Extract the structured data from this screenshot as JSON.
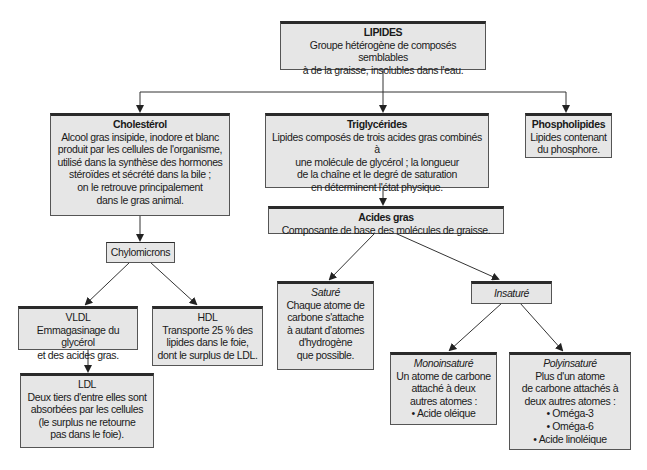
{
  "diagram": {
    "root": {
      "title": "LIPIDES",
      "desc": "Groupe hétérogène de composés semblables\nà de la graisse, insolubles dans l'eau."
    },
    "cholesterol": {
      "title": "Cholestérol",
      "desc": "Alcool gras insipide, inodore et blanc\nproduit par les cellules de l'organisme,\nutilisé dans la synthèse des hormones\nstéroïdes et sécrété dans la bile ;\non le retrouve principalement\ndans le gras animal."
    },
    "triglycerides": {
      "title": "Triglycérides",
      "desc": "Lipides composés de trois acides gras combinés à\nune molécule de glycérol ; la longueur\nde la chaîne et le degré de saturation\nen déterminent l'état physique."
    },
    "phospholipides": {
      "title": "Phospholipides",
      "desc": "Lipides contenant\ndu phosphore."
    },
    "acides_gras": {
      "title": "Acides gras",
      "desc": "Composante de base des molécules de graisse."
    },
    "chylomicrons": {
      "title": "Chylomicrons"
    },
    "vldl": {
      "title": "VLDL",
      "desc": "Emmagasinage du glycérol\net des acides gras."
    },
    "hdl": {
      "title": "HDL",
      "desc": "Transporte 25 % des\nlipides dans le foie,\ndont le surplus de LDL."
    },
    "ldl": {
      "title": "LDL",
      "desc": "Deux tiers d'entre elles sont\nabsorbées par les cellules\n(le surplus ne retourne\npas dans le foie)."
    },
    "sature": {
      "title": "Saturé",
      "desc": "Chaque atome de\ncarbone s'attache\nà autant d'atomes\nd'hydrogène\nque possible."
    },
    "insature": {
      "title": "Insaturé"
    },
    "monoinsature": {
      "title": "Monoinsaturé",
      "desc": "Un atome de carbone\nattaché à deux\nautres atomes :\n• Acide oléique"
    },
    "polyinsature": {
      "title": "Polyinsaturé",
      "desc": "Plus d'un atome\nde carbone attachés à\ndeux autres atomes :\n• Oméga-3\n• Oméga-6\n• Acide linoléique"
    },
    "colors": {
      "box_fill": "#e6e6e6",
      "box_border": "#555555",
      "box_top_border": "#2a2a2a",
      "line": "#333333"
    }
  }
}
